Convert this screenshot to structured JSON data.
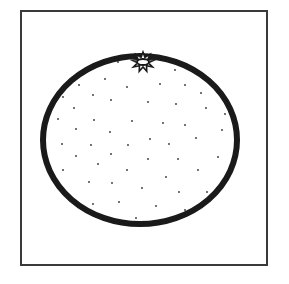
{
  "illustration": {
    "subject": "orange",
    "style": "black line art on white",
    "colors": {
      "background": "#ffffff",
      "frame": "#3a3a3a",
      "outline": "#1a1a1a",
      "dots": "#333333"
    },
    "frame": {
      "x": 20,
      "y": 10,
      "width": 248,
      "height": 256,
      "stroke": 2
    },
    "fruit": {
      "cx": 140,
      "cy": 140,
      "rx": 97,
      "ry": 84,
      "stroke": 6
    },
    "calyx": {
      "cx": 143,
      "cy": 62,
      "points": 9,
      "outer_r": 11,
      "inner_r": 5.5,
      "hole_rx": 6,
      "hole_ry": 3
    },
    "dots": [
      [
        118,
        62
      ],
      [
        175,
        70
      ],
      [
        105,
        79
      ],
      [
        79,
        85
      ],
      [
        127,
        87
      ],
      [
        160,
        84
      ],
      [
        185,
        85
      ],
      [
        63,
        97
      ],
      [
        93,
        95
      ],
      [
        111,
        100
      ],
      [
        148,
        102
      ],
      [
        201,
        93
      ],
      [
        176,
        104
      ],
      [
        74,
        108
      ],
      [
        206,
        108
      ],
      [
        58,
        119
      ],
      [
        94,
        120
      ],
      [
        132,
        121
      ],
      [
        163,
        123
      ],
      [
        185,
        125
      ],
      [
        225,
        114
      ],
      [
        76,
        129
      ],
      [
        110,
        132
      ],
      [
        222,
        130
      ],
      [
        196,
        138
      ],
      [
        62,
        144
      ],
      [
        91,
        145
      ],
      [
        128,
        145
      ],
      [
        150,
        139
      ],
      [
        169,
        144
      ],
      [
        76,
        156
      ],
      [
        111,
        154
      ],
      [
        148,
        159
      ],
      [
        178,
        159
      ],
      [
        218,
        157
      ],
      [
        98,
        164
      ],
      [
        63,
        170
      ],
      [
        127,
        170
      ],
      [
        198,
        170
      ],
      [
        166,
        177
      ],
      [
        89,
        182
      ],
      [
        112,
        183
      ],
      [
        142,
        188
      ],
      [
        179,
        192
      ],
      [
        207,
        192
      ],
      [
        93,
        204
      ],
      [
        119,
        202
      ],
      [
        156,
        206
      ],
      [
        185,
        210
      ],
      [
        136,
        218
      ]
    ]
  }
}
